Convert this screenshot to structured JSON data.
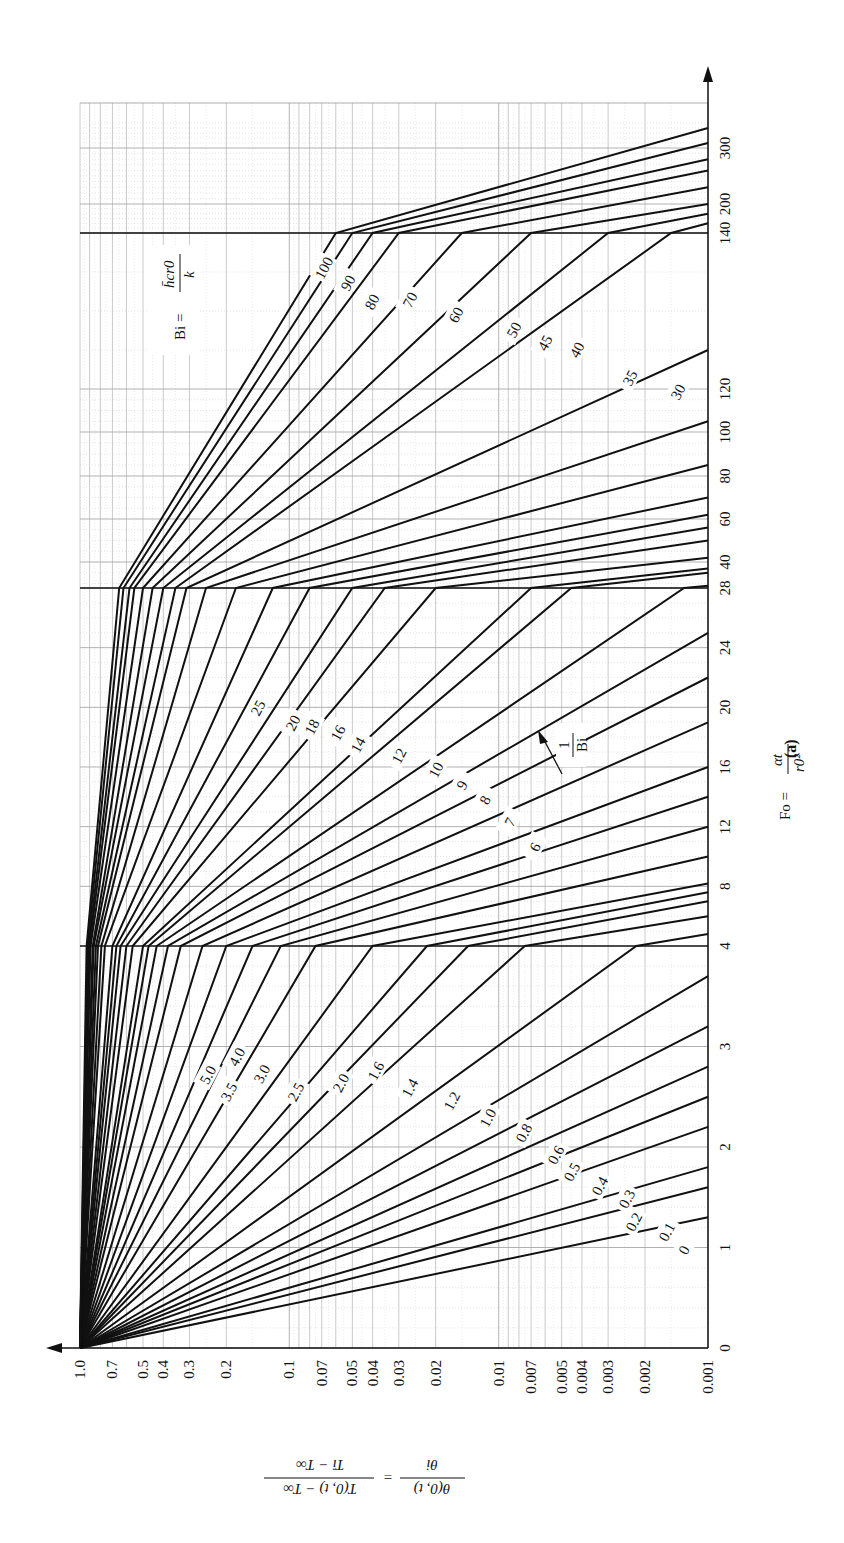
{
  "figure_label": "(a)",
  "x_axis_title": "Fo = αt / r0²",
  "y_axis_title": "θ(0,t)/θi = (T(0,t) − T∞)/(Ti − T∞)",
  "bi_label": "Bi = h̄c r0 / k",
  "inverse_bi_label": "1/Bi",
  "chart_data": {
    "type": "line",
    "xlabel": "Fo = αt / r0²",
    "ylabel": "θ(0,t)/θi = (T(0,t) − T∞)/(Ti − T∞)",
    "orientation": "rotated 90° counter-clockwise (Fo axis vertical, θ axis horizontal)",
    "fo_ticks": [
      0,
      1,
      2,
      3,
      4,
      8,
      12,
      16,
      20,
      24,
      28,
      40,
      60,
      80,
      100,
      120,
      140,
      200,
      300
    ],
    "theta_ticks": [
      "1.0",
      "0.7",
      "0.5",
      "0.4",
      "0.3",
      "0.2",
      "0.1",
      "0.07",
      "0.05",
      "0.04",
      "0.03",
      "0.02",
      "0.01",
      "0.007",
      "0.005",
      "0.004",
      "0.003",
      "0.002",
      "0.001"
    ],
    "theta_scale": "log",
    "fo_scale": "piecewise linear (0–4, 4–28, 28–140, 140–300)",
    "ylim": [
      0.001,
      1.0
    ],
    "xlim": [
      0,
      300
    ],
    "grid": true,
    "legend_title": "1/Bi",
    "series": [
      {
        "name": "0",
        "points": [
          [
            0,
            1.0
          ],
          [
            1.3,
            0.001
          ]
        ]
      },
      {
        "name": "0.1",
        "points": [
          [
            0,
            1.0
          ],
          [
            1.6,
            0.001
          ]
        ]
      },
      {
        "name": "0.2",
        "points": [
          [
            0,
            1.0
          ],
          [
            1.8,
            0.001
          ]
        ]
      },
      {
        "name": "0.3",
        "points": [
          [
            0,
            1.0
          ],
          [
            2.2,
            0.001
          ]
        ]
      },
      {
        "name": "0.4",
        "points": [
          [
            0,
            1.0
          ],
          [
            2.5,
            0.001
          ]
        ]
      },
      {
        "name": "0.5",
        "points": [
          [
            0,
            1.0
          ],
          [
            2.8,
            0.001
          ]
        ]
      },
      {
        "name": "0.6",
        "points": [
          [
            0,
            1.0
          ],
          [
            3.2,
            0.001
          ]
        ]
      },
      {
        "name": "0.8",
        "points": [
          [
            0,
            1.0
          ],
          [
            3.7,
            0.001
          ]
        ]
      },
      {
        "name": "1.0",
        "points": [
          [
            0,
            1.0
          ],
          [
            4,
            0.0022
          ],
          [
            4.8,
            0.001
          ]
        ]
      },
      {
        "name": "1.2",
        "points": [
          [
            0,
            1.0
          ],
          [
            4,
            0.0075
          ],
          [
            6.0,
            0.001
          ]
        ]
      },
      {
        "name": "1.4",
        "points": [
          [
            0,
            1.0
          ],
          [
            4,
            0.014
          ],
          [
            7.0,
            0.001
          ]
        ]
      },
      {
        "name": "1.6",
        "points": [
          [
            0,
            1.0
          ],
          [
            4,
            0.022
          ],
          [
            7.6,
            0.001
          ]
        ]
      },
      {
        "name": "2.0",
        "points": [
          [
            0,
            1.0
          ],
          [
            4,
            0.04
          ],
          [
            8.2,
            0.001
          ]
        ]
      },
      {
        "name": "2.5",
        "points": [
          [
            0,
            1.0
          ],
          [
            4,
            0.075
          ],
          [
            10,
            0.001
          ]
        ]
      },
      {
        "name": "3.0",
        "points": [
          [
            0,
            1.0
          ],
          [
            4,
            0.11
          ],
          [
            12,
            0.001
          ]
        ]
      },
      {
        "name": "3.5",
        "points": [
          [
            0,
            1.0
          ],
          [
            4,
            0.15
          ],
          [
            14,
            0.001
          ]
        ]
      },
      {
        "name": "4.0",
        "points": [
          [
            0,
            1.0
          ],
          [
            4,
            0.2
          ],
          [
            16,
            0.001
          ]
        ]
      },
      {
        "name": "5.0",
        "points": [
          [
            0,
            1.0
          ],
          [
            4,
            0.26
          ],
          [
            19,
            0.001
          ]
        ]
      },
      {
        "name": "6",
        "points": [
          [
            0,
            1.0
          ],
          [
            4,
            0.33
          ],
          [
            22,
            0.001
          ]
        ]
      },
      {
        "name": "7",
        "points": [
          [
            0,
            1.0
          ],
          [
            4,
            0.38
          ],
          [
            25,
            0.001
          ]
        ]
      },
      {
        "name": "8",
        "points": [
          [
            0,
            1.0
          ],
          [
            4,
            0.43
          ],
          [
            28,
            0.0013
          ],
          [
            29,
            0.001
          ]
        ]
      },
      {
        "name": "9",
        "points": [
          [
            0,
            1.0
          ],
          [
            4,
            0.47
          ],
          [
            28,
            0.0045
          ],
          [
            35,
            0.001
          ]
        ]
      },
      {
        "name": "10",
        "points": [
          [
            0,
            1.0
          ],
          [
            4,
            0.5
          ],
          [
            28,
            0.007
          ],
          [
            37,
            0.001
          ]
        ]
      },
      {
        "name": "12",
        "points": [
          [
            0,
            1.0
          ],
          [
            4,
            0.56
          ],
          [
            28,
            0.02
          ],
          [
            42,
            0.001
          ]
        ]
      },
      {
        "name": "14",
        "points": [
          [
            0,
            1.0
          ],
          [
            4,
            0.6
          ],
          [
            28,
            0.035
          ],
          [
            50,
            0.001
          ]
        ]
      },
      {
        "name": "16",
        "points": [
          [
            0,
            1.0
          ],
          [
            4,
            0.64
          ],
          [
            28,
            0.05
          ],
          [
            56,
            0.001
          ]
        ]
      },
      {
        "name": "18",
        "points": [
          [
            0,
            1.0
          ],
          [
            4,
            0.67
          ],
          [
            28,
            0.08
          ],
          [
            62,
            0.001
          ]
        ]
      },
      {
        "name": "20",
        "points": [
          [
            0,
            1.0
          ],
          [
            4,
            0.7
          ],
          [
            28,
            0.12
          ],
          [
            70,
            0.001
          ]
        ]
      },
      {
        "name": "25",
        "points": [
          [
            0,
            1.0
          ],
          [
            4,
            0.76
          ],
          [
            28,
            0.18
          ],
          [
            85,
            0.001
          ]
        ]
      },
      {
        "name": "30",
        "points": [
          [
            0,
            1.0
          ],
          [
            4,
            0.79
          ],
          [
            28,
            0.25
          ],
          [
            105,
            0.001
          ]
        ]
      },
      {
        "name": "35",
        "points": [
          [
            0,
            1.0
          ],
          [
            4,
            0.82
          ],
          [
            28,
            0.31
          ],
          [
            125,
            0.001
          ]
        ]
      },
      {
        "name": "40",
        "points": [
          [
            0,
            1.0
          ],
          [
            4,
            0.84
          ],
          [
            28,
            0.35
          ],
          [
            140,
            0.0015
          ],
          [
            160,
            0.001
          ]
        ]
      },
      {
        "name": "45",
        "points": [
          [
            0,
            1.0
          ],
          [
            4,
            0.86
          ],
          [
            28,
            0.4
          ],
          [
            140,
            0.003
          ],
          [
            180,
            0.001
          ]
        ]
      },
      {
        "name": "50",
        "points": [
          [
            0,
            1.0
          ],
          [
            4,
            0.87
          ],
          [
            28,
            0.45
          ],
          [
            140,
            0.007
          ],
          [
            200,
            0.001
          ]
        ]
      },
      {
        "name": "60",
        "points": [
          [
            0,
            1.0
          ],
          [
            4,
            0.89
          ],
          [
            28,
            0.5
          ],
          [
            140,
            0.015
          ],
          [
            230,
            0.001
          ]
        ]
      },
      {
        "name": "70",
        "points": [
          [
            0,
            1.0
          ],
          [
            4,
            0.9
          ],
          [
            28,
            0.55
          ],
          [
            140,
            0.03
          ],
          [
            260,
            0.001
          ]
        ]
      },
      {
        "name": "80",
        "points": [
          [
            0,
            1.0
          ],
          [
            4,
            0.91
          ],
          [
            28,
            0.58
          ],
          [
            140,
            0.04
          ],
          [
            280,
            0.001
          ]
        ]
      },
      {
        "name": "90",
        "points": [
          [
            0,
            1.0
          ],
          [
            4,
            0.92
          ],
          [
            28,
            0.62
          ],
          [
            140,
            0.05
          ],
          [
            310,
            0.001
          ]
        ]
      },
      {
        "name": "100",
        "points": [
          [
            0,
            1.0
          ],
          [
            4,
            0.93
          ],
          [
            28,
            0.65
          ],
          [
            140,
            0.06
          ],
          [
            340,
            0.001
          ]
        ]
      }
    ]
  }
}
